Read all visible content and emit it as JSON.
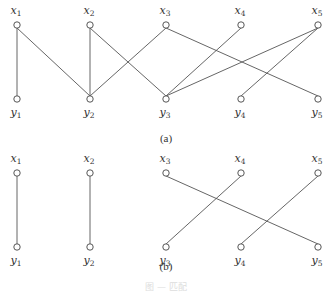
{
  "figure": {
    "caption": "图 — 匹配",
    "subfigures": [
      {
        "id": "a",
        "label": "(a)",
        "top_nodes": [
          {
            "id": "x1",
            "name": "x",
            "sub": "1"
          },
          {
            "id": "x2",
            "name": "x",
            "sub": "2"
          },
          {
            "id": "x3",
            "name": "x",
            "sub": "3"
          },
          {
            "id": "x4",
            "name": "x",
            "sub": "4"
          },
          {
            "id": "x5",
            "name": "x",
            "sub": "5"
          }
        ],
        "bottom_nodes": [
          {
            "id": "y1",
            "name": "y",
            "sub": "1"
          },
          {
            "id": "y2",
            "name": "y",
            "sub": "2"
          },
          {
            "id": "y3",
            "name": "y",
            "sub": "3"
          },
          {
            "id": "y4",
            "name": "y",
            "sub": "4"
          },
          {
            "id": "y5",
            "name": "y",
            "sub": "5"
          }
        ],
        "edges": [
          [
            "x1",
            "y1"
          ],
          [
            "x1",
            "y2"
          ],
          [
            "x2",
            "y2"
          ],
          [
            "x2",
            "y3"
          ],
          [
            "x3",
            "y2"
          ],
          [
            "x3",
            "y5"
          ],
          [
            "x4",
            "y3"
          ],
          [
            "x5",
            "y3"
          ],
          [
            "x5",
            "y4"
          ]
        ]
      },
      {
        "id": "b",
        "label": "(b)",
        "top_nodes": [
          {
            "id": "x1",
            "name": "x",
            "sub": "1"
          },
          {
            "id": "x2",
            "name": "x",
            "sub": "2"
          },
          {
            "id": "x3",
            "name": "x",
            "sub": "3"
          },
          {
            "id": "x4",
            "name": "x",
            "sub": "4"
          },
          {
            "id": "x5",
            "name": "x",
            "sub": "5"
          }
        ],
        "bottom_nodes": [
          {
            "id": "y1",
            "name": "y",
            "sub": "1"
          },
          {
            "id": "y2",
            "name": "y",
            "sub": "2"
          },
          {
            "id": "y3",
            "name": "y",
            "sub": "3"
          },
          {
            "id": "y4",
            "name": "y",
            "sub": "4"
          },
          {
            "id": "y5",
            "name": "y",
            "sub": "5"
          }
        ],
        "edges": [
          [
            "x1",
            "y1"
          ],
          [
            "x2",
            "y2"
          ],
          [
            "x3",
            "y5"
          ],
          [
            "x4",
            "y3"
          ],
          [
            "x5",
            "y4"
          ]
        ]
      }
    ]
  }
}
